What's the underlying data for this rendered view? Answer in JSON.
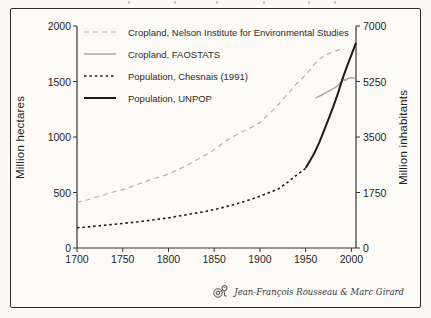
{
  "signature": {
    "text": "Jean-François Rousseau & Marc Girard"
  },
  "colors": {
    "axis": "#333333",
    "cropland_nelson": "#b2b2b2",
    "cropland_faostat": "#9e9e9e",
    "population_black": "#1c1c1c"
  },
  "chart_data": {
    "type": "line",
    "title": "",
    "x_axis": {
      "label": "",
      "range": [
        1700,
        2005
      ],
      "ticks": [
        1700,
        1750,
        1800,
        1850,
        1900,
        1950,
        2000
      ]
    },
    "y_left": {
      "label": "Million hectares",
      "range": [
        0,
        2000
      ],
      "ticks": [
        0,
        500,
        1000,
        1500,
        2000
      ]
    },
    "y_right": {
      "label": "Million inhabitants",
      "range": [
        0,
        7000
      ],
      "ticks": [
        0,
        1750,
        3500,
        5250,
        7000
      ]
    },
    "grid": false,
    "legend_position": "top-left-inside",
    "series": [
      {
        "name": "Cropland, Nelson Institute for Environmental Studies",
        "axis": "left",
        "style": "dashed",
        "color": "#b2b2b2",
        "width": 1.2,
        "points": [
          [
            1700,
            410
          ],
          [
            1710,
            430
          ],
          [
            1720,
            455
          ],
          [
            1730,
            480
          ],
          [
            1740,
            505
          ],
          [
            1750,
            525
          ],
          [
            1760,
            555
          ],
          [
            1770,
            585
          ],
          [
            1780,
            615
          ],
          [
            1790,
            640
          ],
          [
            1800,
            665
          ],
          [
            1810,
            705
          ],
          [
            1820,
            745
          ],
          [
            1830,
            790
          ],
          [
            1840,
            835
          ],
          [
            1850,
            885
          ],
          [
            1860,
            950
          ],
          [
            1870,
            1000
          ],
          [
            1880,
            1045
          ],
          [
            1890,
            1085
          ],
          [
            1900,
            1130
          ],
          [
            1910,
            1210
          ],
          [
            1920,
            1290
          ],
          [
            1930,
            1385
          ],
          [
            1940,
            1480
          ],
          [
            1950,
            1560
          ],
          [
            1955,
            1610
          ],
          [
            1960,
            1660
          ],
          [
            1965,
            1700
          ],
          [
            1970,
            1730
          ],
          [
            1975,
            1750
          ],
          [
            1980,
            1770
          ],
          [
            1985,
            1780
          ],
          [
            1990,
            1800
          ],
          [
            1992,
            1790
          ]
        ]
      },
      {
        "name": "Cropland, FAOSTATS",
        "axis": "left",
        "style": "solid",
        "color": "#9e9e9e",
        "width": 1.3,
        "points": [
          [
            1961,
            1350
          ],
          [
            1964,
            1365
          ],
          [
            1967,
            1375
          ],
          [
            1970,
            1390
          ],
          [
            1973,
            1405
          ],
          [
            1976,
            1415
          ],
          [
            1979,
            1430
          ],
          [
            1982,
            1445
          ],
          [
            1985,
            1460
          ],
          [
            1988,
            1490
          ],
          [
            1991,
            1520
          ],
          [
            1993,
            1510
          ],
          [
            1996,
            1525
          ],
          [
            2000,
            1535
          ],
          [
            2003,
            1530
          ],
          [
            2005,
            1540
          ]
        ]
      },
      {
        "name": "Population, Chesnais (1991)",
        "axis": "right",
        "style": "dotted",
        "color": "#1c1c1c",
        "width": 1.6,
        "points": [
          [
            1700,
            640
          ],
          [
            1710,
            660
          ],
          [
            1720,
            690
          ],
          [
            1730,
            715
          ],
          [
            1740,
            745
          ],
          [
            1750,
            775
          ],
          [
            1760,
            805
          ],
          [
            1770,
            840
          ],
          [
            1780,
            875
          ],
          [
            1790,
            910
          ],
          [
            1800,
            950
          ],
          [
            1810,
            1000
          ],
          [
            1820,
            1050
          ],
          [
            1830,
            1100
          ],
          [
            1840,
            1150
          ],
          [
            1850,
            1210
          ],
          [
            1860,
            1280
          ],
          [
            1870,
            1360
          ],
          [
            1880,
            1440
          ],
          [
            1890,
            1530
          ],
          [
            1900,
            1630
          ],
          [
            1910,
            1750
          ],
          [
            1920,
            1860
          ],
          [
            1930,
            2070
          ],
          [
            1940,
            2300
          ],
          [
            1945,
            2400
          ],
          [
            1950,
            2520
          ]
        ]
      },
      {
        "name": "Population, UNPOP",
        "axis": "right",
        "style": "solid",
        "color": "#1c1c1c",
        "width": 2.0,
        "points": [
          [
            1950,
            2520
          ],
          [
            1955,
            2770
          ],
          [
            1960,
            3020
          ],
          [
            1965,
            3340
          ],
          [
            1970,
            3700
          ],
          [
            1975,
            4070
          ],
          [
            1980,
            4440
          ],
          [
            1985,
            4850
          ],
          [
            1990,
            5320
          ],
          [
            1995,
            5720
          ],
          [
            2000,
            6090
          ],
          [
            2005,
            6470
          ]
        ]
      }
    ]
  }
}
